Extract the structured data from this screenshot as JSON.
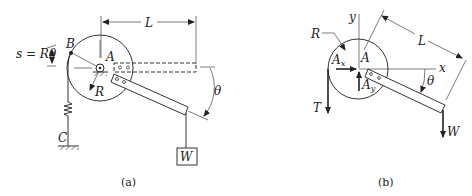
{
  "figure_a": {
    "caption": "(a)",
    "labels": {
      "L": "L",
      "B": "B",
      "A": "A",
      "R": "R",
      "C": "C",
      "W": "W",
      "theta": "θ",
      "arc_length": "s = Rθ"
    }
  },
  "figure_b": {
    "caption": "(b)",
    "labels": {
      "y": "y",
      "x": "x",
      "R": "R",
      "L": "L",
      "A": "A",
      "Ax": "A",
      "Ax_sub": "x",
      "Ay": "A",
      "Ay_sub": "y",
      "T": "T",
      "W": "W",
      "theta": "θ"
    }
  }
}
